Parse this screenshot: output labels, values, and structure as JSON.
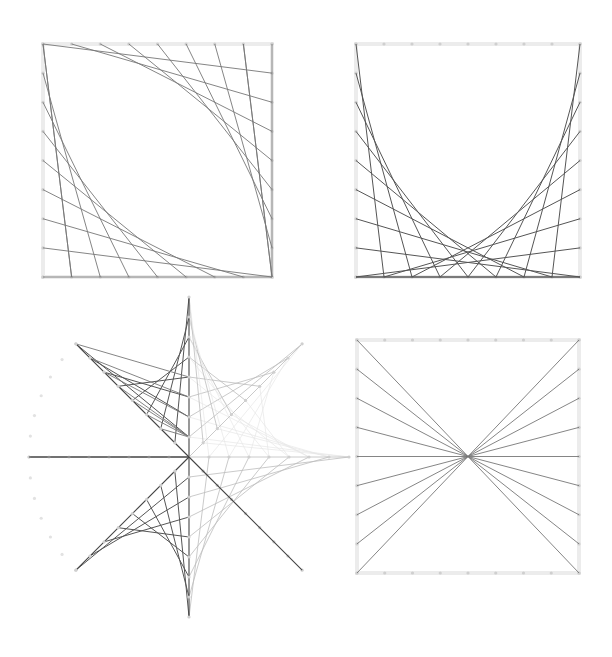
{
  "figure": {
    "width": 612,
    "height": 657,
    "background": "#ffffff",
    "panels": [
      {
        "id": "panel-top-left",
        "type": "square-string-art-leaf",
        "box": {
          "x0": 43,
          "y0": 44,
          "x1": 272,
          "y1": 277
        },
        "pins_per_side": 9,
        "pattern": "top-to-right and left-to-bottom envelope curves forming a lens"
      },
      {
        "id": "panel-top-right",
        "type": "square-string-art-u",
        "box": {
          "x0": 356,
          "y0": 44,
          "x1": 580,
          "y1": 277
        },
        "pins_per_side": 9,
        "pattern": "left-to-bottom and right-to-bottom envelope curves forming a U"
      },
      {
        "id": "panel-bottom-left",
        "type": "star-string-art",
        "center": {
          "x": 189,
          "y": 457
        },
        "radius": 160,
        "pins_per_ray": 8,
        "pattern": "eight rays with parabolic string envelopes between adjacent rays; dark in left quadrants, light in right quadrants, faint pin arc on left"
      },
      {
        "id": "panel-bottom-right",
        "type": "square-string-art-bowtie",
        "box": {
          "x0": 357,
          "y0": 340,
          "x1": 579,
          "y1": 573
        },
        "pins_per_side": 9,
        "pattern": "all left-edge pins connected through center to opposite right-edge pins"
      }
    ],
    "colors": {
      "frame": "#ececec",
      "pin": "#cfcfcf",
      "string_dark": "#555555",
      "string_mid": "#777777",
      "string_light": "#bdbdbd",
      "string_faint": "#e6e6e6"
    }
  }
}
